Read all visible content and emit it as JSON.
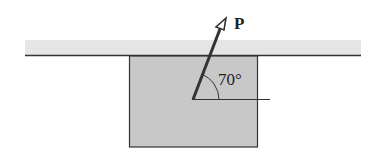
{
  "diagram": {
    "force_label": "P",
    "angle_label": "70°",
    "angle_degrees": 70,
    "colors": {
      "block_fill": "#c8c8c8",
      "surface_band": "#e6e6e6",
      "line": "#333333"
    }
  }
}
